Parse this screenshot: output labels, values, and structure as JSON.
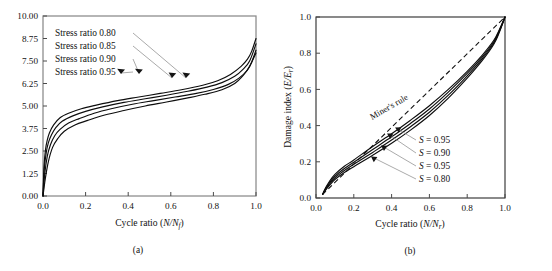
{
  "figure": {
    "panels": [
      {
        "id": "a",
        "caption": "(a)",
        "xlabel_main": "Cycle ratio (",
        "xlabel_math": "N/N",
        "xlabel_sub": "f",
        "xlabel_close": ")",
        "xlabel_full": "Cycle ratio (N/Nf)",
        "ylabel_full": "",
        "xticks": [
          "0.0",
          "0.2",
          "0.4",
          "0.6",
          "0.8",
          "1.0"
        ],
        "yticks": [
          "0.00",
          "1.25",
          "2.50",
          "3.75",
          "5.00",
          "6.25",
          "7.50",
          "8.75",
          "10.00"
        ],
        "legend": [
          "Stress ratio 0.80",
          "Stress ratio 0.85",
          "Stress ratio 0.90",
          "Stress ratio 0.95"
        ]
      },
      {
        "id": "b",
        "caption": "(b)",
        "xlabel_main": "Cycle ratio (",
        "xlabel_math": "N/N",
        "xlabel_sub": "r",
        "xlabel_close": ")",
        "xlabel_full": "Cycle ratio (N/Nr)",
        "ylabel_main": "Damage index (",
        "ylabel_math": "E/E",
        "ylabel_sub": "r",
        "ylabel_close": ")",
        "ylabel_full": "Damage index (E/Er)",
        "xticks": [
          "0.0",
          "0.2",
          "0.4",
          "0.6",
          "0.8",
          "1.0"
        ],
        "yticks": [
          "0.0",
          "0.2",
          "0.4",
          "0.6",
          "0.8",
          "1.0"
        ],
        "annotation_miner": "Miner's rule",
        "series_labels": [
          {
            "sym": "S",
            "eq": " = 0.95"
          },
          {
            "sym": "S",
            "eq": " = 0.90"
          },
          {
            "sym": "S",
            "eq": " = 0.95"
          },
          {
            "sym": "S",
            "eq": " = 0.80"
          }
        ]
      }
    ]
  },
  "chart_data": [
    {
      "type": "line",
      "panel": "a",
      "title": "",
      "xlabel": "Cycle ratio (N/Nf)",
      "ylabel": "",
      "xlim": [
        0.0,
        1.0
      ],
      "ylim": [
        0.0,
        10.0
      ],
      "xticks": [
        0.0,
        0.2,
        0.4,
        0.6,
        0.8,
        1.0
      ],
      "yticks": [
        0.0,
        1.25,
        2.5,
        3.75,
        5.0,
        6.25,
        7.5,
        8.75,
        10.0
      ],
      "grid": false,
      "legend_position": "upper-left",
      "series": [
        {
          "name": "Stress ratio 0.80",
          "x": [
            0.0,
            0.005,
            0.012,
            0.02,
            0.03,
            0.05,
            0.08,
            0.12,
            0.18,
            0.25,
            0.35,
            0.45,
            0.55,
            0.65,
            0.75,
            0.82,
            0.88,
            0.93,
            0.96,
            0.98,
            1.0
          ],
          "y": [
            0.0,
            1.7,
            2.6,
            3.1,
            3.5,
            3.95,
            4.35,
            4.6,
            4.85,
            5.05,
            5.3,
            5.5,
            5.7,
            5.9,
            6.15,
            6.4,
            6.75,
            7.2,
            7.6,
            8.05,
            8.75
          ]
        },
        {
          "name": "Stress ratio 0.85",
          "x": [
            0.0,
            0.006,
            0.015,
            0.025,
            0.04,
            0.06,
            0.09,
            0.14,
            0.2,
            0.28,
            0.38,
            0.48,
            0.58,
            0.68,
            0.77,
            0.84,
            0.9,
            0.94,
            0.97,
            1.0
          ],
          "y": [
            0.0,
            1.5,
            2.4,
            2.95,
            3.4,
            3.8,
            4.15,
            4.45,
            4.7,
            4.95,
            5.2,
            5.4,
            5.6,
            5.82,
            6.05,
            6.3,
            6.65,
            7.05,
            7.5,
            8.45
          ]
        },
        {
          "name": "Stress ratio 0.90",
          "x": [
            0.0,
            0.008,
            0.02,
            0.035,
            0.055,
            0.08,
            0.12,
            0.17,
            0.24,
            0.32,
            0.42,
            0.52,
            0.62,
            0.72,
            0.8,
            0.87,
            0.92,
            0.96,
            0.98,
            1.0
          ],
          "y": [
            0.0,
            1.2,
            2.2,
            2.85,
            3.35,
            3.7,
            4.05,
            4.3,
            4.6,
            4.85,
            5.1,
            5.3,
            5.5,
            5.7,
            5.92,
            6.2,
            6.55,
            7.0,
            7.45,
            8.1
          ]
        },
        {
          "name": "Stress ratio 0.95",
          "x": [
            0.0,
            0.01,
            0.025,
            0.045,
            0.07,
            0.1,
            0.15,
            0.21,
            0.29,
            0.38,
            0.48,
            0.58,
            0.68,
            0.76,
            0.84,
            0.9,
            0.94,
            0.97,
            1.0
          ],
          "y": [
            0.0,
            0.9,
            1.9,
            2.7,
            3.2,
            3.6,
            3.95,
            4.2,
            4.5,
            4.75,
            5.0,
            5.22,
            5.45,
            5.65,
            5.9,
            6.25,
            6.7,
            7.2,
            7.95
          ]
        }
      ]
    },
    {
      "type": "line",
      "panel": "b",
      "title": "",
      "xlabel": "Cycle ratio (N/Nr)",
      "ylabel": "Damage index (E/Er)",
      "xlim": [
        0.0,
        1.0
      ],
      "ylim": [
        0.0,
        1.0
      ],
      "xticks": [
        0.0,
        0.2,
        0.4,
        0.6,
        0.8,
        1.0
      ],
      "yticks": [
        0.0,
        0.2,
        0.4,
        0.6,
        0.8,
        1.0
      ],
      "grid": false,
      "legend_position": "center-right",
      "reference_line": {
        "name": "Miner's rule",
        "style": "dashed",
        "x": [
          0.035,
          1.0
        ],
        "y": [
          0.02,
          1.0
        ]
      },
      "series": [
        {
          "name": "S = 0.95",
          "x": [
            0.035,
            0.05,
            0.07,
            0.1,
            0.15,
            0.2,
            0.3,
            0.4,
            0.5,
            0.6,
            0.7,
            0.8,
            0.88,
            0.94,
            0.97,
            1.0
          ],
          "y": [
            0.02,
            0.055,
            0.09,
            0.13,
            0.175,
            0.21,
            0.285,
            0.355,
            0.43,
            0.51,
            0.6,
            0.7,
            0.79,
            0.87,
            0.93,
            1.0
          ]
        },
        {
          "name": "S = 0.90",
          "x": [
            0.035,
            0.05,
            0.07,
            0.1,
            0.15,
            0.2,
            0.3,
            0.4,
            0.5,
            0.6,
            0.7,
            0.8,
            0.88,
            0.94,
            0.97,
            1.0
          ],
          "y": [
            0.02,
            0.05,
            0.082,
            0.12,
            0.163,
            0.198,
            0.268,
            0.338,
            0.412,
            0.492,
            0.585,
            0.688,
            0.78,
            0.862,
            0.925,
            1.0
          ]
        },
        {
          "name": "S = 0.95",
          "x": [
            0.035,
            0.05,
            0.07,
            0.1,
            0.15,
            0.2,
            0.3,
            0.4,
            0.5,
            0.6,
            0.7,
            0.8,
            0.88,
            0.94,
            0.97,
            1.0
          ],
          "y": [
            0.02,
            0.046,
            0.075,
            0.111,
            0.152,
            0.186,
            0.252,
            0.32,
            0.394,
            0.474,
            0.568,
            0.675,
            0.77,
            0.855,
            0.92,
            1.0
          ]
        },
        {
          "name": "S = 0.80",
          "x": [
            0.035,
            0.05,
            0.07,
            0.1,
            0.15,
            0.2,
            0.3,
            0.4,
            0.5,
            0.6,
            0.7,
            0.8,
            0.88,
            0.94,
            0.97,
            1.0
          ],
          "y": [
            0.02,
            0.042,
            0.068,
            0.102,
            0.141,
            0.173,
            0.236,
            0.302,
            0.375,
            0.456,
            0.552,
            0.662,
            0.76,
            0.848,
            0.915,
            1.0
          ]
        }
      ]
    }
  ]
}
